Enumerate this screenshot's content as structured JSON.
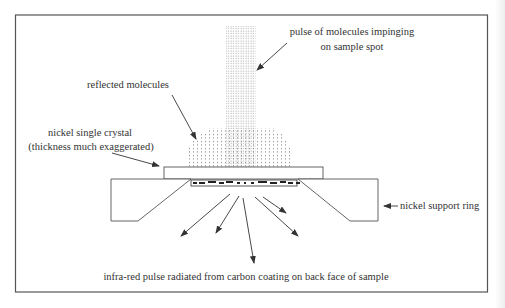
{
  "diagram": {
    "labels": {
      "pulse": [
        "pulse of molecules impinging",
        "on sample spot"
      ],
      "reflected": "reflected molecules",
      "crystal": [
        "nickel single crystal",
        "(thickness much exaggerated)"
      ],
      "support_ring": "nickel support ring",
      "infrared": "infra-red pulse radiated from carbon coating on back face of sample"
    },
    "colors": {
      "line": "#444444",
      "text": "#333333",
      "dots": "#777777",
      "background": "#ffffff"
    }
  }
}
